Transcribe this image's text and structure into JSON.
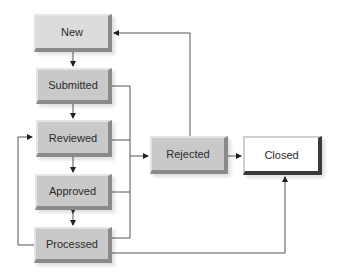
{
  "diagram": {
    "type": "state-workflow",
    "nodes": {
      "new": {
        "label": "New"
      },
      "submitted": {
        "label": "Submitted"
      },
      "reviewed": {
        "label": "Reviewed"
      },
      "approved": {
        "label": "Approved"
      },
      "processed": {
        "label": "Processed"
      },
      "rejected": {
        "label": "Rejected"
      },
      "closed": {
        "label": "Closed"
      }
    },
    "edges": [
      {
        "from": "New",
        "to": "Submitted"
      },
      {
        "from": "Submitted",
        "to": "Reviewed"
      },
      {
        "from": "Reviewed",
        "to": "Approved"
      },
      {
        "from": "Approved",
        "to": "Processed",
        "bidirectional": true
      },
      {
        "from": "Processed",
        "to": "Reviewed"
      },
      {
        "from": "Submitted",
        "to": "Rejected"
      },
      {
        "from": "Reviewed",
        "to": "Rejected"
      },
      {
        "from": "Approved",
        "to": "Rejected"
      },
      {
        "from": "Processed",
        "to": "Rejected"
      },
      {
        "from": "Rejected",
        "to": "New"
      },
      {
        "from": "Rejected",
        "to": "Closed"
      },
      {
        "from": "Processed",
        "to": "Closed"
      }
    ]
  }
}
